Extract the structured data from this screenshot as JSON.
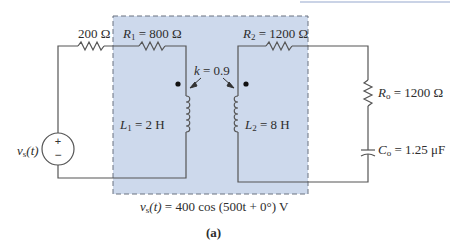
{
  "figure": {
    "caption": "(a)",
    "source_equation": "= 400 cos (500t + 0°) V",
    "source_equation_var": "v",
    "source_equation_sub": "s",
    "source_equation_arg": "(t)",
    "colors": {
      "shaded_region": "#cdd9ec",
      "dashed_border": "#6b7280",
      "wire": "#555555",
      "top_rule": "#b8c4de"
    }
  },
  "components": {
    "source": {
      "var": "v",
      "sub": "s",
      "arg": "(t)",
      "plus": "+",
      "minus": "−"
    },
    "r_series": {
      "label": "200 Ω"
    },
    "r1": {
      "var": "R",
      "sub": "1",
      "value": " = 800 Ω"
    },
    "r2": {
      "var": "R",
      "sub": "2",
      "value": " = 1200 Ω"
    },
    "coupling": {
      "var": "k",
      "value": " = 0.9"
    },
    "l1": {
      "var": "L",
      "sub": "1",
      "value": " = 2 H"
    },
    "l2": {
      "var": "L",
      "sub": "2",
      "value": " = 8 H"
    },
    "ro": {
      "var": "R",
      "sub": "o",
      "value": " = 1200 Ω"
    },
    "co": {
      "var": "C",
      "sub": "o",
      "value": " = 1.25 μF"
    }
  }
}
